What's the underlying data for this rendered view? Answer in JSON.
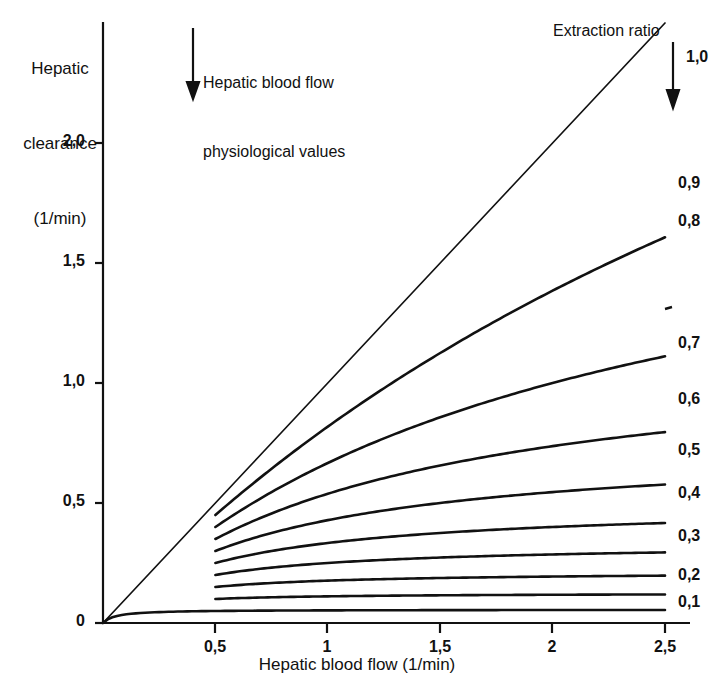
{
  "figure": {
    "background": "#ffffff",
    "ink": "#111111"
  },
  "axes": {
    "y_axis_title_lines": [
      "Hepatic",
      "clearance",
      "(1/min)"
    ],
    "x_axis_title": "Hepatic blood flow (1/min)",
    "y_ticks": [
      {
        "label": "0",
        "value": 0.0
      },
      {
        "label": "0,5",
        "value": 0.5
      },
      {
        "label": "1,0",
        "value": 1.0
      },
      {
        "label": "1,5",
        "value": 1.5
      },
      {
        "label": "2,0",
        "value": 2.0
      }
    ],
    "x_ticks": [
      {
        "label": "0,5",
        "value": 0.5
      },
      {
        "label": "1",
        "value": 1.0
      },
      {
        "label": "1,5",
        "value": 1.5
      },
      {
        "label": "2",
        "value": 2.0
      },
      {
        "label": "2,5",
        "value": 2.5
      }
    ],
    "xlim": [
      0,
      2.5
    ],
    "ylim": [
      0,
      2.5
    ],
    "grid": false
  },
  "annotations": {
    "hepatic_flow_note_lines": [
      "Hepatic blood flow",
      "physiological values"
    ],
    "extraction_ratio_title": "Extraction ratio"
  },
  "chart_data": {
    "type": "line",
    "title": "",
    "xlabel": "Hepatic blood flow (1/min)",
    "ylabel": "Hepatic clearance (1/min)",
    "xlim": [
      0,
      2.5
    ],
    "ylim": [
      0,
      2.5
    ],
    "grid": false,
    "legend_position": "right-of-curve-ends",
    "legend_title": "Extraction ratio",
    "x": [
      0.0,
      0.25,
      0.5,
      0.75,
      1.0,
      1.25,
      1.5,
      1.75,
      2.0,
      2.25,
      2.5
    ],
    "series": [
      {
        "name": "1,0",
        "extraction_ratio": 1.0,
        "label": "1,0",
        "starts_at_x": 0.0,
        "values": [
          0.0,
          0.25,
          0.5,
          0.75,
          1.0,
          1.25,
          1.5,
          1.75,
          2.0,
          2.25,
          2.5
        ]
      },
      {
        "name": "0,9",
        "extraction_ratio": 0.9,
        "label": "0,9",
        "starts_at_x": 0.5,
        "values": [
          null,
          null,
          0.45,
          0.64,
          0.81,
          0.964,
          1.104,
          1.232,
          1.35,
          1.459,
          1.56
        ]
      },
      {
        "name": "0,8",
        "extraction_ratio": 0.8,
        "label": "0,8",
        "starts_at_x": 0.5,
        "values": [
          null,
          null,
          0.4,
          0.558,
          0.696,
          0.816,
          0.923,
          1.019,
          1.106,
          1.185,
          1.257
        ]
      },
      {
        "name": "0,7",
        "extraction_ratio": 0.7,
        "label": "0,7",
        "starts_at_x": 0.5,
        "values": [
          null,
          null,
          0.35,
          0.478,
          0.587,
          0.68,
          0.761,
          0.832,
          0.895,
          0.952,
          1.003
        ]
      },
      {
        "name": "0,6",
        "extraction_ratio": 0.6,
        "label": "0,6",
        "starts_at_x": 0.5,
        "values": [
          null,
          null,
          0.3,
          0.402,
          0.486,
          0.556,
          0.616,
          0.668,
          0.713,
          0.753,
          0.789
        ]
      },
      {
        "name": "0,5",
        "extraction_ratio": 0.5,
        "label": "0,5",
        "starts_at_x": 0.5,
        "values": [
          null,
          null,
          0.25,
          0.328,
          0.391,
          0.442,
          0.485,
          0.521,
          0.553,
          0.58,
          0.604
        ]
      },
      {
        "name": "0,4",
        "extraction_ratio": 0.4,
        "label": "0,4",
        "starts_at_x": 0.5,
        "values": [
          null,
          null,
          0.2,
          0.257,
          0.302,
          0.338,
          0.367,
          0.392,
          0.413,
          0.431,
          0.447
        ]
      },
      {
        "name": "0,3",
        "extraction_ratio": 0.3,
        "label": "0,3",
        "starts_at_x": 0.5,
        "values": [
          null,
          null,
          0.15,
          0.189,
          0.219,
          0.242,
          0.261,
          0.277,
          0.29,
          0.301,
          0.311
        ]
      },
      {
        "name": "0,2",
        "extraction_ratio": 0.2,
        "label": "0,2",
        "starts_at_x": 0.5,
        "values": [
          null,
          null,
          0.1,
          0.124,
          0.141,
          0.155,
          0.166,
          0.174,
          0.181,
          0.187,
          0.192
        ]
      },
      {
        "name": "0,1",
        "extraction_ratio": 0.1,
        "label": "0,1",
        "starts_at_x": 0.0,
        "values": [
          0.0,
          0.029,
          0.05,
          0.061,
          0.069,
          0.074,
          0.078,
          0.081,
          0.084,
          0.086,
          0.088
        ]
      }
    ],
    "annotations": [
      {
        "text": "Hepatic blood flow physiological values",
        "type": "down-arrow",
        "at_x": 0.94
      },
      {
        "text": "Extraction ratio",
        "type": "down-arrow",
        "at_x": 2.5
      }
    ]
  }
}
